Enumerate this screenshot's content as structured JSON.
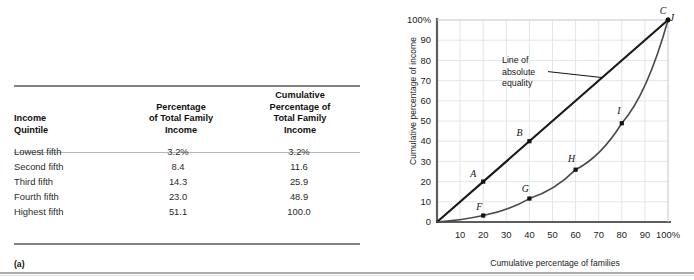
{
  "panel_a": {
    "tag": "(a)",
    "table": {
      "headers": [
        "Income\nQuintile",
        "Percentage\nof Total Family\nIncome",
        "Cumulative\nPercentage of\nTotal Family\nIncome"
      ],
      "header_lines": {
        "col0": [
          "Income",
          "Quintile"
        ],
        "col1": [
          "Percentage",
          "of Total Family",
          "Income"
        ],
        "col2": [
          "Cumulative",
          "Percentage of",
          "Total Family",
          "Income"
        ]
      },
      "rows": [
        {
          "quintile": "Lowest fifth",
          "percentage": "3.2%",
          "cumulative": "3.2%"
        },
        {
          "quintile": "Second fifth",
          "percentage": "8.4",
          "cumulative": "11.6"
        },
        {
          "quintile": "Third fifth",
          "percentage": "14.3",
          "cumulative": "25.9"
        },
        {
          "quintile": "Fourth fifth",
          "percentage": "23.0",
          "cumulative": "48.9"
        },
        {
          "quintile": "Highest fifth",
          "percentage": "51.1",
          "cumulative": "100.0"
        }
      ]
    }
  },
  "panel_b": {
    "tag": "(b)",
    "annotation_lines": [
      "Line of",
      "absolute",
      "equality"
    ]
  },
  "chart_data": {
    "type": "line",
    "title": "",
    "xlabel": "Cumulative percentage of families",
    "ylabel": "Cumulative percentage of income",
    "xlim": [
      0,
      100
    ],
    "ylim": [
      0,
      100
    ],
    "grid": true,
    "xticks": [
      "10",
      "20",
      "30",
      "40",
      "50",
      "60",
      "70",
      "80",
      "90",
      "100%"
    ],
    "xtick_values": [
      10,
      20,
      30,
      40,
      50,
      60,
      70,
      80,
      90,
      100
    ],
    "yticks": [
      "0",
      "10",
      "20",
      "30",
      "40",
      "50",
      "60",
      "70",
      "80",
      "90",
      "100%"
    ],
    "ytick_values": [
      0,
      10,
      20,
      30,
      40,
      50,
      60,
      70,
      80,
      90,
      100
    ],
    "annotations": [
      {
        "text": "Line of absolute equality",
        "x": 33,
        "y": 72
      }
    ],
    "series": [
      {
        "name": "Line of absolute equality",
        "type": "line",
        "color": "#1a1a1a",
        "width": 2.2,
        "x": [
          0,
          100
        ],
        "y": [
          0,
          100
        ],
        "points": [
          {
            "label": "A",
            "x": 20,
            "y": 20
          },
          {
            "label": "B",
            "x": 40,
            "y": 40
          },
          {
            "label": "C",
            "x": 100,
            "y": 100
          }
        ]
      },
      {
        "name": "Lorenz curve",
        "type": "line",
        "color": "#4a4a4a",
        "width": 1.6,
        "x": [
          0,
          20,
          40,
          60,
          80,
          100
        ],
        "y": [
          0,
          3.2,
          11.6,
          25.9,
          48.9,
          100
        ],
        "points": [
          {
            "label": "F",
            "x": 20,
            "y": 3.2
          },
          {
            "label": "G",
            "x": 40,
            "y": 11.6
          },
          {
            "label": "H",
            "x": 60,
            "y": 25.9
          },
          {
            "label": "I",
            "x": 80,
            "y": 48.9
          },
          {
            "label": "J",
            "x": 100,
            "y": 100
          }
        ]
      }
    ],
    "point_labels": {
      "A": "A",
      "B": "B",
      "C": "C",
      "F": "F",
      "G": "G",
      "H": "H",
      "I": "I",
      "J": "J"
    }
  }
}
